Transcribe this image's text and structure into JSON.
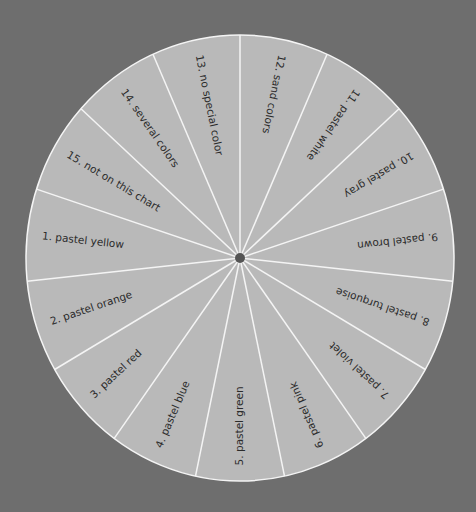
{
  "chart_data": {
    "type": "pie",
    "title": "",
    "segments_count": 15,
    "equal_segments": true,
    "categories": [
      "1. pastel yellow",
      "2. pastel orange",
      "3. pastel red",
      "4. pastel blue",
      "5. pastel green",
      "6. pastel pink",
      "7. pastel violet",
      "8. pastel turquoise",
      "9. pastel brown",
      "10. pastel gray",
      "11. pastel white",
      "12. sand colors",
      "13. no special color",
      "14. several colors",
      "15. not on this chart"
    ],
    "values": [
      1,
      1,
      1,
      1,
      1,
      1,
      1,
      1,
      1,
      1,
      1,
      1,
      1,
      1,
      1
    ],
    "first_segment_center_deg": 174,
    "segment_step_deg": 24
  },
  "colors": {
    "background": "#6e6e6e",
    "wheel_fill": "#b9b9b9",
    "divider": "#f4f4f4",
    "hub": "#555555",
    "text": "#2b2b2b"
  },
  "wheel": {
    "cx": 240,
    "cy": 258,
    "rx": 214,
    "ry": 223,
    "hub_radius": 5
  }
}
